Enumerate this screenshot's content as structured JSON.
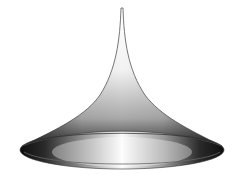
{
  "figure": {
    "subject": "pseudosphere-like horn surface",
    "background": "#ffffff",
    "colors": {
      "outline": "#555555",
      "dark": "#1a1a1a",
      "mid": "#8a8a8a",
      "light": "#f4f4f4"
    }
  }
}
